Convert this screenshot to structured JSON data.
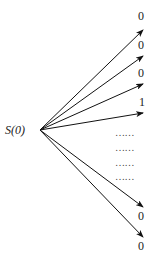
{
  "root": {
    "label": "S(0)"
  },
  "branches": [
    {
      "outcome": "0",
      "tip": [
        143,
        30
      ],
      "label_pos": [
        138,
        9
      ]
    },
    {
      "outcome": "0",
      "tip": [
        143,
        56
      ],
      "label_pos": [
        138,
        38
      ]
    },
    {
      "outcome": "0",
      "tip": [
        143,
        84
      ],
      "label_pos": [
        138,
        66
      ]
    },
    {
      "outcome": "1",
      "tip": [
        143,
        113
      ],
      "label_pos": [
        139,
        95
      ]
    },
    {
      "outcome": "0",
      "tip": [
        143,
        207
      ],
      "label_pos": [
        138,
        212
      ]
    },
    {
      "outcome": "0",
      "tip": [
        143,
        237
      ],
      "label_pos": [
        138,
        242
      ]
    }
  ],
  "ellipsis": [
    "……",
    "……",
    "……",
    "……"
  ]
}
